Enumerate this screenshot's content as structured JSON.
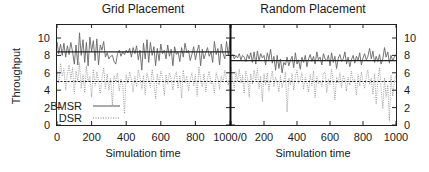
{
  "chart_data": [
    {
      "type": "line",
      "title": "Grid Placement",
      "xlabel": "Simulation time",
      "ylabel": "Throughput",
      "xlim": [
        0,
        1000
      ],
      "ylim": [
        0,
        11
      ],
      "xticks": [
        0,
        200,
        400,
        600,
        800,
        1000
      ],
      "yticks": [
        0,
        2,
        4,
        6,
        8,
        10
      ],
      "grid": false,
      "legend": {
        "position": "lower-left",
        "entries": [
          "BMSR",
          "DSR"
        ]
      },
      "x": [
        0,
        10,
        20,
        30,
        40,
        50,
        60,
        70,
        80,
        90,
        100,
        110,
        120,
        130,
        140,
        150,
        160,
        170,
        180,
        190,
        200,
        210,
        220,
        230,
        240,
        250,
        260,
        270,
        280,
        290,
        300,
        310,
        320,
        330,
        340,
        350,
        360,
        370,
        380,
        390,
        400,
        410,
        420,
        430,
        440,
        450,
        460,
        470,
        480,
        490,
        500,
        510,
        520,
        530,
        540,
        550,
        560,
        570,
        580,
        590,
        600,
        610,
        620,
        630,
        640,
        650,
        660,
        670,
        680,
        690,
        700,
        710,
        720,
        730,
        740,
        750,
        760,
        770,
        780,
        790,
        800,
        810,
        820,
        830,
        840,
        850,
        860,
        870,
        880,
        890,
        900,
        910,
        920,
        930,
        940,
        950,
        960,
        970,
        980,
        990,
        1000
      ],
      "series": [
        {
          "name": "BMSR",
          "style": "solid",
          "mean": 8.4,
          "values": [
            9.6,
            8.2,
            9.3,
            8.0,
            9.4,
            7.8,
            9.1,
            8.1,
            9.5,
            8.4,
            7.0,
            9.2,
            6.9,
            10.6,
            8.0,
            9.8,
            7.2,
            9.5,
            6.8,
            10.1,
            8.4,
            9.7,
            7.4,
            9.9,
            6.9,
            9.2,
            8.6,
            9.6,
            7.8,
            8.3,
            7.6,
            7.9,
            8.0,
            7.3,
            7.0,
            8.2,
            8.6,
            7.9,
            8.4,
            8.1,
            8.6,
            8.3,
            8.8,
            7.8,
            8.9,
            8.2,
            9.1,
            7.5,
            8.6,
            6.3,
            9.4,
            7.6,
            9.8,
            7.2,
            9.5,
            8.0,
            9.0,
            6.8,
            8.8,
            7.4,
            9.3,
            8.2,
            8.6,
            7.6,
            9.2,
            7.9,
            8.7,
            6.8,
            9.0,
            8.1,
            8.4,
            7.3,
            8.9,
            7.8,
            9.4,
            8.3,
            8.6,
            7.4,
            8.1,
            9.0,
            7.5,
            8.5,
            9.2,
            6.8,
            8.7,
            7.6,
            8.3,
            8.9,
            7.9,
            8.4,
            7.2,
            9.6,
            8.1,
            8.8,
            6.9,
            9.3,
            8.2,
            7.6,
            9.6,
            8.0,
            9.9
          ]
        },
        {
          "name": "DSR",
          "style": "dotted",
          "mean": 5.0,
          "values": [
            6.2,
            4.8,
            7.1,
            5.6,
            6.5,
            4.0,
            5.9,
            6.9,
            5.3,
            6.6,
            3.6,
            6.2,
            5.0,
            7.2,
            4.2,
            5.8,
            3.7,
            6.8,
            4.9,
            5.6,
            3.2,
            6.4,
            4.5,
            6.1,
            5.1,
            3.6,
            5.5,
            6.6,
            4.2,
            5.9,
            4.0,
            5.4,
            2.3,
            5.7,
            5.0,
            6.0,
            3.9,
            5.3,
            4.6,
            1.3,
            5.8,
            4.8,
            6.1,
            5.2,
            3.8,
            5.6,
            4.4,
            6.3,
            5.5,
            4.1,
            5.7,
            3.5,
            6.0,
            5.2,
            4.3,
            6.4,
            5.0,
            3.0,
            5.9,
            4.6,
            6.2,
            5.4,
            3.4,
            5.8,
            4.7,
            6.0,
            5.3,
            4.0,
            5.5,
            6.1,
            4.2,
            5.7,
            3.1,
            6.3,
            4.8,
            5.6,
            3.9,
            5.2,
            6.0,
            4.5,
            5.8,
            3.3,
            6.7,
            5.1,
            4.4,
            5.9,
            3.8,
            5.4,
            6.2,
            4.7,
            5.0,
            3.6,
            6.0,
            5.3,
            4.1,
            5.6,
            4.9,
            6.3,
            5.2,
            4.6,
            5.8
          ]
        }
      ]
    },
    {
      "type": "line",
      "title": "Random Placement",
      "xlabel": "Simulation time",
      "ylabel": "",
      "xlim": [
        0,
        1000
      ],
      "ylim": [
        0,
        11
      ],
      "xticks": [
        0,
        200,
        400,
        600,
        800,
        1000
      ],
      "yticks": [
        0,
        2,
        4,
        6,
        8,
        10
      ],
      "ytick_side": "right",
      "grid": false,
      "x": [
        0,
        10,
        20,
        30,
        40,
        50,
        60,
        70,
        80,
        90,
        100,
        110,
        120,
        130,
        140,
        150,
        160,
        170,
        180,
        190,
        200,
        210,
        220,
        230,
        240,
        250,
        260,
        270,
        280,
        290,
        300,
        310,
        320,
        330,
        340,
        350,
        360,
        370,
        380,
        390,
        400,
        410,
        420,
        430,
        440,
        450,
        460,
        470,
        480,
        490,
        500,
        510,
        520,
        530,
        540,
        550,
        560,
        570,
        580,
        590,
        600,
        610,
        620,
        630,
        640,
        650,
        660,
        670,
        680,
        690,
        700,
        710,
        720,
        730,
        740,
        750,
        760,
        770,
        780,
        790,
        800,
        810,
        820,
        830,
        840,
        850,
        860,
        870,
        880,
        890,
        900,
        910,
        920,
        930,
        940,
        950,
        960,
        970,
        980,
        990,
        1000
      ],
      "series": [
        {
          "name": "BMSR",
          "style": "solid",
          "mean": 7.4,
          "values": [
            7.9,
            8.1,
            7.6,
            8.0,
            7.7,
            8.2,
            7.5,
            8.0,
            7.8,
            7.3,
            8.1,
            7.6,
            8.3,
            7.2,
            8.4,
            7.0,
            8.5,
            7.4,
            8.2,
            7.7,
            8.0,
            6.9,
            8.3,
            7.5,
            8.7,
            7.1,
            7.9,
            6.3,
            8.0,
            6.5,
            7.6,
            6.0,
            7.2,
            6.9,
            7.8,
            6.8,
            7.4,
            7.9,
            6.6,
            8.3,
            7.0,
            7.5,
            6.4,
            7.8,
            7.2,
            8.0,
            6.7,
            7.6,
            8.1,
            7.3,
            7.9,
            7.0,
            8.4,
            7.5,
            7.8,
            6.9,
            8.2,
            7.6,
            7.4,
            8.0,
            6.8,
            8.3,
            7.2,
            7.9,
            6.5,
            7.7,
            8.1,
            7.3,
            7.6,
            8.4,
            7.0,
            7.8,
            6.7,
            7.5,
            8.0,
            7.1,
            7.9,
            7.4,
            8.3,
            6.9,
            7.7,
            8.2,
            7.5,
            7.9,
            8.8,
            7.6,
            8.5,
            7.2,
            7.9,
            7.3,
            8.1,
            7.0,
            7.6,
            8.9,
            7.8,
            8.4,
            7.1,
            8.0,
            7.4,
            7.8,
            8.1
          ]
        },
        {
          "name": "DSR",
          "style": "dotted",
          "mean": 5.0,
          "values": [
            6.6,
            5.2,
            4.3,
            6.1,
            5.0,
            6.4,
            4.8,
            5.7,
            3.6,
            6.2,
            5.4,
            3.2,
            5.9,
            4.7,
            6.3,
            5.1,
            6.5,
            4.2,
            5.6,
            2.7,
            5.9,
            4.6,
            6.0,
            3.9,
            5.3,
            6.2,
            4.4,
            5.5,
            4.9,
            3.8,
            5.7,
            4.3,
            5.0,
            6.1,
            1.5,
            5.4,
            4.6,
            5.9,
            4.0,
            5.6,
            6.3,
            4.8,
            5.2,
            6.0,
            4.1,
            5.5,
            4.9,
            3.8,
            5.8,
            4.5,
            6.2,
            3.1,
            5.6,
            4.7,
            5.1,
            4.4,
            5.9,
            6.1,
            3.7,
            5.3,
            4.6,
            6.4,
            5.0,
            2.9,
            5.5,
            4.8,
            6.0,
            4.3,
            5.7,
            5.2,
            3.9,
            5.5,
            4.6,
            6.2,
            4.9,
            5.3,
            3.4,
            5.8,
            4.5,
            6.1,
            5.0,
            4.2,
            5.6,
            6.3,
            4.7,
            5.4,
            3.5,
            5.9,
            2.4,
            5.2,
            6.6,
            4.1,
            1.9,
            5.4,
            3.2,
            4.6,
            0.4,
            5.7,
            3.3,
            5.0,
            5.8
          ]
        }
      ]
    }
  ]
}
